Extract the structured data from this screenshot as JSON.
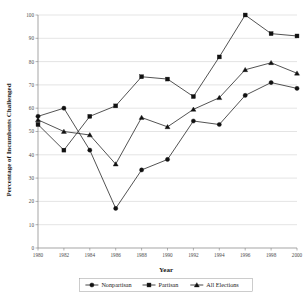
{
  "chart_data": {
    "type": "line",
    "title": "",
    "xlabel": "Year",
    "ylabel": "Percentage of Incumbents Challenged",
    "x": [
      1980,
      1982,
      1984,
      1986,
      1988,
      1990,
      1992,
      1994,
      1996,
      1998,
      2000
    ],
    "xtick_labels": [
      "1980",
      "1982",
      "1984",
      "1986",
      "1988",
      "1990",
      "1992",
      "1994",
      "1996",
      "1998",
      "2000"
    ],
    "ytick_labels": [
      "0",
      "10",
      "20",
      "30",
      "40",
      "50",
      "60",
      "70",
      "80",
      "90",
      "100"
    ],
    "yticks": [
      0,
      10,
      20,
      30,
      40,
      50,
      60,
      70,
      80,
      90,
      100
    ],
    "ylim": [
      0,
      100
    ],
    "xlim": [
      1980,
      2000
    ],
    "grid": true,
    "legend_position": "bottom",
    "series": [
      {
        "name": "Nonpartisan",
        "marker": "circle",
        "values": [
          56.5,
          60.0,
          42.0,
          17.0,
          33.5,
          38.0,
          54.5,
          53.0,
          65.5,
          71.0,
          68.5
        ]
      },
      {
        "name": "Partisan",
        "marker": "square",
        "values": [
          53.0,
          42.0,
          56.5,
          61.0,
          73.5,
          72.5,
          65.0,
          82.0,
          100.0,
          92.0,
          91.0
        ]
      },
      {
        "name": "All Elections",
        "marker": "triangle",
        "values": [
          55.0,
          50.0,
          48.5,
          36.0,
          56.0,
          52.0,
          59.5,
          64.5,
          76.5,
          79.5,
          75.0
        ]
      }
    ]
  },
  "legend": {
    "items": [
      {
        "label": "Nonpartisan",
        "marker": "circle"
      },
      {
        "label": "Partisan",
        "marker": "square"
      },
      {
        "label": "All Elections",
        "marker": "triangle"
      }
    ]
  },
  "axes": {
    "x_title": "Year",
    "y_title": "Percentage of Incumbents Challenged"
  }
}
